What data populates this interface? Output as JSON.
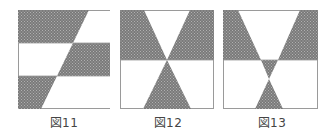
{
  "figures": [
    {
      "id": "fig11",
      "caption": "図11",
      "description": "Square divided into three horizontal bands, each split by a slanted diagonal; shaded parallelogram sections alternate left/right"
    },
    {
      "id": "fig12",
      "caption": "図12",
      "description": "Square with two diagonal lines crossing at center of horizontal midline forming shaded hourglass/bowtie regions"
    },
    {
      "id": "fig13",
      "caption": "図13",
      "description": "Square with V-shaped lines; shaded top corners, small central triangle and lower triangle meeting at a point"
    }
  ],
  "colors": {
    "shade": "#7a7a7a",
    "shade_dot": "#a5a5a5",
    "border": "#9a9a9a",
    "background": "#ffffff"
  }
}
